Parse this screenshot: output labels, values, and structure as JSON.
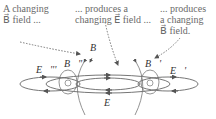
{
  "captions": {
    "left": {
      "line1": "A changing",
      "line2": "B⃗ field ..."
    },
    "middle": {
      "line1": "... produces a",
      "line2": "changing E⃗ field ..."
    },
    "right": {
      "line1": "... produces",
      "line2": "a changing",
      "line3": "B⃗ field."
    }
  },
  "labels": {
    "B": "B⃗",
    "B_prime": "B⃗'",
    "B_double_prime": "B⃗\"",
    "E": "E⃗",
    "E_prime": "E⃗'",
    "E_triple_prime": "E⃗'''"
  },
  "colors": {
    "lines": "#666666",
    "dotted_arrows": "#777777"
  }
}
